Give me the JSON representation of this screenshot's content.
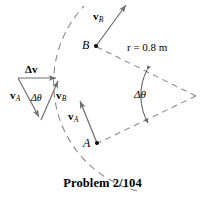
{
  "figure": {
    "caption": "Problem 2/104",
    "colors": {
      "stroke": "#000000",
      "dashed": "#7a7a7a",
      "background": "#ffffff"
    },
    "labels": {
      "point_a": "A",
      "point_b": "B",
      "radius": "r = 0.8 m",
      "delta_theta_wedge": "Δθ",
      "delta_theta_triangle": "Δθ",
      "delta_v": "Δv",
      "v_a_main": "v",
      "v_a_main_sub": "A",
      "v_b_main": "v",
      "v_b_main_sub": "B",
      "v_a_tri": "v",
      "v_a_tri_sub": "A",
      "v_b_tri": "v",
      "v_b_tri_sub": "B"
    },
    "values": {
      "radius_symbol": "r",
      "radius_value": "0.8",
      "radius_unit": "m",
      "problem_number": "2/104"
    },
    "geometry": {
      "center": {
        "x": 196,
        "y": 96
      },
      "point_b": {
        "x": 96,
        "y": 46
      },
      "point_a": {
        "x": 97,
        "y": 143
      },
      "arc_radius_px": 112
    }
  }
}
